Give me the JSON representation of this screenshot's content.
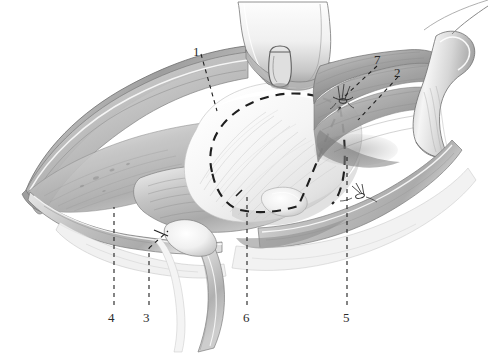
{
  "figure": {
    "kind": "anatomical-surgical-illustration",
    "style": "grayscale pencil / graphite medical illustration",
    "background_color": "#ffffff",
    "ink_color": "#2b2b2b",
    "width": 488,
    "height": 363
  },
  "callouts": [
    {
      "id": "1",
      "label": "1",
      "label_x": 197,
      "label_y": 45,
      "leader": "dashed",
      "tip_x": 216,
      "tip_y": 110
    },
    {
      "id": "2",
      "label": "2",
      "label_x": 398,
      "label_y": 66,
      "leader": "dashed",
      "tip_x": 358,
      "tip_y": 118
    },
    {
      "id": "3",
      "label": "3",
      "label_x": 146,
      "label_y": 313,
      "leader": "dashed",
      "tip_x": 163,
      "tip_y": 232
    },
    {
      "id": "4",
      "label": "4",
      "label_x": 110,
      "label_y": 313,
      "leader": "dashed",
      "tip_x": 115,
      "tip_y": 206
    },
    {
      "id": "5",
      "label": "5",
      "label_x": 345,
      "label_y": 313,
      "leader": "dashed",
      "tip_x": 348,
      "tip_y": 156
    },
    {
      "id": "6",
      "label": "6",
      "label_x": 245,
      "label_y": 313,
      "leader": "dashed",
      "tip_x": 247,
      "tip_y": 197
    },
    {
      "id": "7",
      "label": "7",
      "label_x": 378,
      "label_y": 57,
      "leader": "dashed",
      "tip_x": 343,
      "tip_y": 98
    }
  ],
  "annotation_marks": {
    "incision_outline": "dashed closed curve over the exposed cuff tendon",
    "suture_upper_right": "small suture with knot and loose thread ends",
    "suture_lower_right": "small suture with knot and loose thread ends"
  },
  "palette": {
    "ink": "#2b2b2b",
    "tissue_light": "#f2f2f2",
    "tissue_mid": "#c9c9c9",
    "tissue_dark": "#8f8f8f",
    "tissue_shadow": "#6e6e6e",
    "tendon_white": "#fafafa",
    "outline": "#5a5a5a"
  }
}
